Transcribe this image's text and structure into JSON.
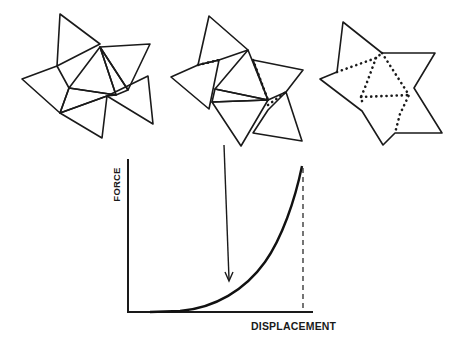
{
  "figure": {
    "stroke_color": "#1a1a1a",
    "background": "#ffffff",
    "shapes": [
      {
        "name": "folding-stage-1-unfolded-triangles",
        "polygons": [
          "60,14 100,44 57,66",
          "100,47 150,44 128,90",
          "100,47 69,88 116,95",
          "100,47 116,95 128,90",
          "57,66 22,79 60,113 69,88",
          "60,113 107,96 102,138",
          "107,96 148,76 153,124",
          "69,88 116,95 107,96 60,113"
        ],
        "folds": []
      },
      {
        "name": "folding-stage-2-partially-folded",
        "polygons": [
          "209,16 248,50 219,60 198,65",
          "198,65 171,77 209,109 219,60",
          "248,50 215,89 268,100",
          "215,89 212,102 268,100",
          "212,102 241,146 268,100",
          "253,60 303,70 286,92 268,100",
          "286,92 302,141 253,133 268,110"
        ],
        "folds": [
          "198,65 219,60",
          "253,60 268,100",
          "268,105 286,92"
        ]
      },
      {
        "name": "folding-stage-3-folded-star",
        "polygons": [
          "343,22 382,53 435,53 414,88 442,133 395,133 383,145 362,111 320,79 337,72"
        ],
        "folds": [
          "337,72 376,58 382,53",
          "376,58 366,85 361,97 363,105",
          "361,97 410,95",
          "382,53 409,95 400,114 395,133"
        ]
      }
    ]
  },
  "chart_data": {
    "type": "line",
    "title": "",
    "xlabel": "DISPLACEMENT",
    "ylabel": "FORCE",
    "grid": false,
    "legend": null,
    "x_ticks": [],
    "y_ticks": [],
    "xlim": [
      0,
      1
    ],
    "ylim": [
      0,
      1
    ],
    "series": [
      {
        "name": "force-displacement",
        "x": [
          0.0,
          0.29,
          0.4,
          0.5,
          0.6,
          0.7,
          0.8,
          0.9,
          0.95
        ],
        "y": [
          0.0,
          0.0,
          0.06,
          0.15,
          0.27,
          0.42,
          0.6,
          0.81,
          0.95
        ]
      }
    ],
    "annotations": [
      {
        "type": "arrow",
        "label": "",
        "from": [
          0.52,
          1.1
        ],
        "to": [
          0.54,
          0.2
        ]
      },
      {
        "type": "dashed-vertical",
        "x": 0.95,
        "from_y": 0,
        "to_y": 0.95
      }
    ]
  },
  "chart_geometry": {
    "axis_path": "M128,159 L128,312 L313,312",
    "curve_path": "M150,312 L180,311 C215,308 245,290 265,262 C282,238 295,200 302,166",
    "dash_path": "M303,168 L303,311",
    "arrow_path": "M224,145 L229,279",
    "arrowhead_path": "M225,272 L229,281 L233,272"
  },
  "labels": {
    "ylabel": "FORCE",
    "xlabel": "DISPLACEMENT"
  }
}
